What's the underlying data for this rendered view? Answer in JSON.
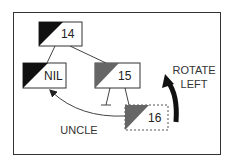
{
  "diagram": {
    "type": "red-black-tree-rotation",
    "nodes": [
      {
        "id": "n14",
        "label": "14",
        "color": "black",
        "fill": "#111111",
        "border": "solid"
      },
      {
        "id": "nNIL",
        "label": "NIL",
        "color": "black",
        "fill": "#111111",
        "border": "solid"
      },
      {
        "id": "n15",
        "label": "15",
        "color": "red",
        "fill": "#666666",
        "border": "solid"
      },
      {
        "id": "n16",
        "label": "16",
        "color": "red",
        "fill": "#666666",
        "border": "dashed"
      }
    ],
    "edges": [
      {
        "from": "n14",
        "to": "nNIL"
      },
      {
        "from": "n14",
        "to": "n15"
      },
      {
        "from": "n15",
        "to": "null-leaf"
      },
      {
        "from": "n15",
        "to": "n16"
      }
    ],
    "annotations": {
      "uncle": "UNCLE",
      "rotate_line1": "ROTATE",
      "rotate_line2": "LEFT"
    },
    "colors": {
      "black_node": "#111111",
      "red_node": "#666666",
      "line": "#444444",
      "border": "#333333"
    }
  }
}
